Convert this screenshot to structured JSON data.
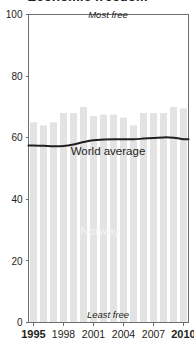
{
  "figure": {
    "title_fragment": "Economic freedom",
    "most_free_label": "Most free",
    "least_free_label": "Least free",
    "world_average_label": "World average",
    "country_label": "Norway",
    "bar_color": "#e3e3e3",
    "line_color": "#231f20",
    "axis_color": "#6d6e71",
    "country_label_color": "#f4f4f4"
  },
  "chart_data": {
    "type": "bar",
    "title": "Economic freedom",
    "xlabel": "",
    "ylabel": "",
    "ylim": [
      0,
      100
    ],
    "yticks": [
      0,
      20,
      40,
      60,
      80,
      100
    ],
    "ytick_labels": [
      "0",
      "20",
      "40",
      "60",
      "80",
      "100"
    ],
    "grid": false,
    "legend": "inline-annotations",
    "categories": [
      "1995",
      "1996",
      "1997",
      "1998",
      "1999",
      "2000",
      "2001",
      "2002",
      "2003",
      "2004",
      "2005",
      "2006",
      "2007",
      "2008",
      "2009",
      "2010"
    ],
    "xtick_labels": [
      "1995",
      "1998",
      "2001",
      "2004",
      "2007",
      "2010"
    ],
    "xtick_bold": [
      "1995",
      "2010"
    ],
    "series": [
      {
        "name": "Norway",
        "type": "bar",
        "values": [
          65.0,
          64.0,
          65.0,
          68.0,
          68.0,
          70.0,
          67.0,
          67.5,
          67.5,
          66.5,
          64.0,
          68.0,
          68.0,
          68.0,
          70.0,
          69.5
        ]
      },
      {
        "name": "World average",
        "type": "line",
        "values": [
          57.5,
          57.4,
          57.2,
          57.3,
          57.8,
          58.6,
          59.2,
          59.4,
          59.5,
          59.5,
          59.5,
          59.7,
          59.9,
          60.1,
          60.0,
          59.5
        ]
      }
    ],
    "annotations": [
      {
        "text": "Most free",
        "position": "top-center"
      },
      {
        "text": "Least free",
        "position": "bottom-center"
      },
      {
        "text": "World average",
        "position": "inline-below-line"
      },
      {
        "text": "Norway",
        "position": "inline-in-bars"
      }
    ]
  }
}
